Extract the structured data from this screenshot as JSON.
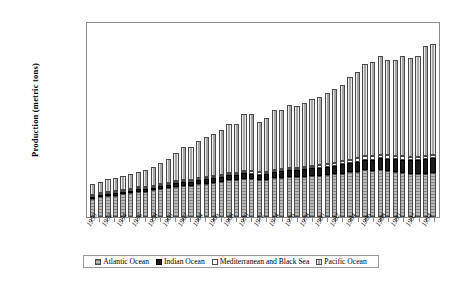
{
  "chart_data": {
    "type": "bar",
    "subtype": "stacked-column",
    "title": "",
    "xlabel": "",
    "ylabel": "Production (metric tons)",
    "ylim": [
      0,
      100000000
    ],
    "ytick_labels": [
      "100,000,000",
      "90,000,000",
      "80,000,000",
      "70,000,000",
      "60,000,000",
      "50,000,000",
      "40,000,000",
      "30,000,000",
      "20,000,000",
      "10,000,000"
    ],
    "ytick_values": [
      100000000,
      90000000,
      80000000,
      70000000,
      60000000,
      50000000,
      40000000,
      30000000,
      20000000,
      10000000
    ],
    "grid": false,
    "legend_position": "bottom",
    "categories": [
      "1950",
      "1951",
      "1952",
      "1953",
      "1954",
      "1955",
      "1956",
      "1957",
      "1958",
      "1959",
      "1960",
      "1961",
      "1962",
      "1963",
      "1964",
      "1965",
      "1966",
      "1967",
      "1968",
      "1969",
      "1970",
      "1971",
      "1972",
      "1973",
      "1974",
      "1975",
      "1976",
      "1977",
      "1978",
      "1979",
      "1980",
      "1981",
      "1982",
      "1983",
      "1984",
      "1985",
      "1986",
      "1987",
      "1988",
      "1989",
      "1990",
      "1991",
      "1992",
      "1993",
      "1994",
      "1995"
    ],
    "xtick_labels_shown": [
      "1950",
      "1952",
      "1954",
      "1956",
      "1958",
      "1960",
      "1962",
      "1964",
      "1966",
      "1968",
      "1970",
      "1972",
      "1974",
      "1976",
      "1978",
      "1980",
      "1982",
      "1984",
      "1986",
      "1988",
      "1990",
      "1992",
      "1994"
    ],
    "series": [
      {
        "name": "Atlantic Ocean",
        "pattern": "gray-horizontal-hatch",
        "values": [
          9800000,
          10500000,
          11200000,
          11300000,
          12000000,
          12500000,
          13200000,
          13300000,
          13800000,
          14500000,
          15000000,
          15600000,
          16200000,
          16000000,
          16800000,
          17200000,
          17600000,
          18200000,
          19000000,
          19200000,
          19800000,
          19600000,
          19000000,
          19200000,
          20000000,
          20200000,
          20600000,
          20400000,
          20800000,
          21200000,
          21400000,
          21600000,
          22000000,
          22400000,
          23000000,
          23400000,
          24000000,
          23800000,
          24200000,
          23800000,
          23200000,
          22800000,
          22400000,
          22000000,
          22400000,
          22600000
        ]
      },
      {
        "name": "Indian Ocean",
        "pattern": "solid-black",
        "values": [
          900000,
          1000000,
          1100000,
          1150000,
          1250000,
          1300000,
          1400000,
          1450000,
          1550000,
          1650000,
          1750000,
          1850000,
          1950000,
          2000000,
          2100000,
          2200000,
          2300000,
          2400000,
          2500000,
          2600000,
          2700000,
          2800000,
          2900000,
          3000000,
          3200000,
          3300000,
          3500000,
          3600000,
          3800000,
          3900000,
          4100000,
          4300000,
          4500000,
          4700000,
          4900000,
          5200000,
          5500000,
          5700000,
          6000000,
          6200000,
          6500000,
          6800000,
          7000000,
          7200000,
          7500000,
          7800000
        ]
      },
      {
        "name": "Mediterranean and Black Sea",
        "pattern": "white-blank",
        "values": [
          600000,
          620000,
          650000,
          660000,
          700000,
          720000,
          750000,
          770000,
          800000,
          820000,
          850000,
          880000,
          900000,
          920000,
          950000,
          980000,
          1000000,
          1020000,
          1050000,
          1080000,
          1100000,
          1120000,
          1150000,
          1180000,
          1200000,
          1250000,
          1300000,
          1350000,
          1400000,
          1450000,
          1500000,
          1550000,
          1600000,
          1650000,
          1700000,
          1750000,
          1800000,
          1820000,
          1850000,
          1800000,
          1750000,
          1700000,
          1650000,
          1600000,
          1620000,
          1650000
        ]
      },
      {
        "name": "Pacific Ocean",
        "pattern": "light-gray-vertical-hatch",
        "values": [
          5700000,
          6080000,
          6850000,
          6890000,
          7050000,
          7480000,
          7650000,
          8480000,
          9850000,
          11030000,
          12400000,
          14670000,
          16950000,
          17080000,
          19150000,
          20620000,
          22100000,
          23380000,
          25450000,
          25120000,
          29400000,
          29480000,
          26050000,
          27620000,
          30650000,
          30250000,
          32600000,
          31650000,
          33000000,
          34450000,
          35000000,
          36550000,
          38000000,
          39250000,
          42400000,
          44650000,
          47700000,
          48680000,
          50900000,
          49200000,
          49550000,
          51700000,
          50950000,
          52200000,
          56460000,
          57000000
        ]
      }
    ]
  },
  "legend": {
    "items": [
      {
        "label": "Atlantic Ocean"
      },
      {
        "label": "Indian Ocean"
      },
      {
        "label": "Mediterranean and Black Sea"
      },
      {
        "label": "Pacific Ocean"
      }
    ]
  }
}
